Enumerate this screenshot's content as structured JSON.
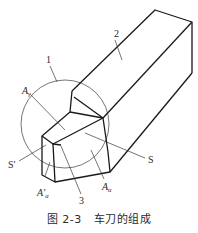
{
  "figure": {
    "number": "图 2-3",
    "title": "车刀的组成",
    "labels": {
      "part_1": "1",
      "part_2": "2",
      "part_3": "3",
      "rake_face": {
        "main": "A",
        "sub": "γ"
      },
      "main_flank": {
        "main": "A",
        "sub": "α"
      },
      "minor_flank": {
        "main": "A′",
        "sub": "α"
      },
      "main_cutting_edge": "S",
      "minor_cutting_edge": "S′"
    }
  },
  "colors": {
    "line": "#1a1a1a",
    "leader": "#3a3a3a",
    "background": "#ffffff"
  }
}
